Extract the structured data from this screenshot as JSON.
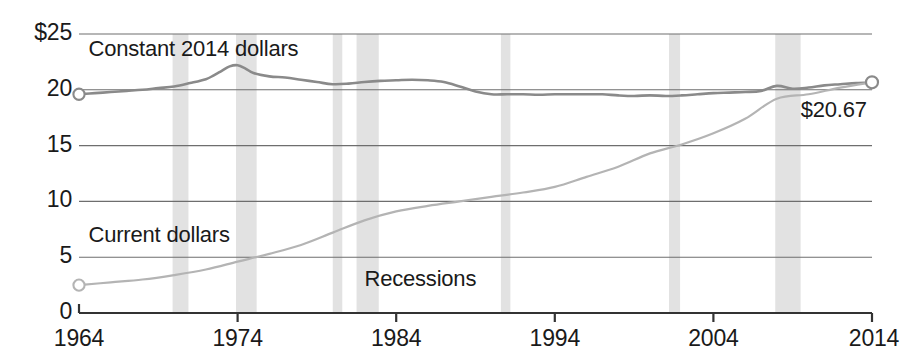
{
  "chart_data": {
    "type": "line",
    "title": "",
    "subtitle": "",
    "xlabel": "",
    "ylabel": "",
    "xlim": [
      1964,
      2014
    ],
    "ylim": [
      0,
      25
    ],
    "grid": true,
    "legend_position": "inline-annotations",
    "y_ticks": [
      "$25",
      "20",
      "15",
      "10",
      "5",
      "0"
    ],
    "y_tick_values": [
      25,
      20,
      15,
      10,
      5,
      0
    ],
    "x_ticks": [
      "1964",
      "1974",
      "1984",
      "1994",
      "2004",
      "2014"
    ],
    "x_tick_values": [
      1964,
      1974,
      1984,
      1994,
      2004,
      2014
    ],
    "annotations": [
      {
        "name": "constant-dollars-label",
        "text": "Constant 2014 dollars",
        "x": 1964.6,
        "y": 23.6
      },
      {
        "name": "current-dollars-label",
        "text": "Current dollars",
        "x": 1964.6,
        "y": 6.9
      },
      {
        "name": "recessions-label",
        "text": "Recessions",
        "x": 1982.0,
        "y": 3.0
      },
      {
        "name": "end-value-label",
        "text": "$20.67",
        "x": 2009.5,
        "y": 18.1
      }
    ],
    "series": [
      {
        "name": "Constant 2014 dollars",
        "color": "#8a8a8a",
        "end_value": 20.67,
        "start_value": 19.6,
        "x": [
          1964,
          1965,
          1966,
          1967,
          1968,
          1969,
          1970,
          1971,
          1972,
          1972.5,
          1973,
          1973.5,
          1974,
          1974.5,
          1975,
          1976,
          1977,
          1978,
          1979,
          1980,
          1981,
          1982,
          1983,
          1984,
          1985,
          1986,
          1987,
          1988,
          1989,
          1990,
          1991,
          1992,
          1993,
          1994,
          1995,
          1996,
          1997,
          1998,
          1999,
          2000,
          2001,
          2002,
          2003,
          2004,
          2005,
          2006,
          2007,
          2008,
          2009,
          2010,
          2011,
          2012,
          2013,
          2014
        ],
        "values": [
          19.6,
          19.7,
          19.8,
          19.9,
          20.0,
          20.15,
          20.3,
          20.6,
          20.95,
          21.3,
          21.7,
          22.1,
          22.2,
          21.9,
          21.5,
          21.2,
          21.1,
          20.9,
          20.7,
          20.5,
          20.55,
          20.7,
          20.8,
          20.85,
          20.9,
          20.85,
          20.7,
          20.3,
          19.85,
          19.6,
          19.6,
          19.6,
          19.55,
          19.6,
          19.6,
          19.6,
          19.6,
          19.5,
          19.45,
          19.5,
          19.45,
          19.5,
          19.6,
          19.7,
          19.75,
          19.8,
          19.9,
          20.35,
          20.1,
          20.2,
          20.4,
          20.5,
          20.6,
          20.67
        ]
      },
      {
        "name": "Current dollars",
        "color": "#b4b4b4",
        "end_value": 20.67,
        "start_value": 2.5,
        "x": [
          1964,
          1966,
          1968,
          1970,
          1972,
          1974,
          1976,
          1978,
          1980,
          1982,
          1984,
          1986,
          1988,
          1990,
          1992,
          1994,
          1996,
          1998,
          2000,
          2002,
          2004,
          2006,
          2008,
          2010,
          2012,
          2014
        ],
        "values": [
          2.5,
          2.75,
          3.0,
          3.4,
          3.9,
          4.6,
          5.3,
          6.1,
          7.2,
          8.3,
          9.1,
          9.6,
          10.0,
          10.4,
          10.8,
          11.3,
          12.2,
          13.1,
          14.3,
          15.1,
          16.1,
          17.4,
          19.2,
          19.6,
          20.2,
          20.67
        ]
      }
    ],
    "recessions": [
      {
        "start": 1969.9,
        "end": 1970.9
      },
      {
        "start": 1973.9,
        "end": 1975.2
      },
      {
        "start": 1980.0,
        "end": 1980.6
      },
      {
        "start": 1981.5,
        "end": 1982.9
      },
      {
        "start": 1990.6,
        "end": 1991.2
      },
      {
        "start": 2001.2,
        "end": 2001.9
      },
      {
        "start": 2007.9,
        "end": 2009.5
      }
    ],
    "recession_band_color": "#e2e2e2",
    "gridline_color": "#6e6e6e",
    "axis_color": "#333333",
    "text_color": "#1a1a1a"
  }
}
